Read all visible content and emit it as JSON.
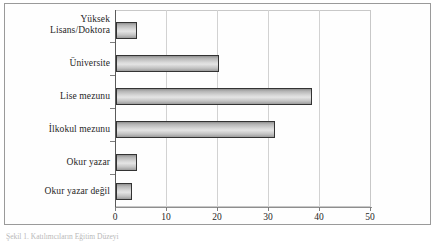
{
  "chart_data": {
    "type": "bar",
    "orientation": "horizontal",
    "title": "",
    "xlabel": "",
    "ylabel": "",
    "categories": [
      "Okur yazar değil",
      "Okur yazar",
      "İlkokul mezunu",
      "Lise mezunu",
      "Üniversite",
      "Yüksek\nLisans/Doktora"
    ],
    "values": [
      3.1,
      4.1,
      31.0,
      38.2,
      20.2,
      4.1
    ],
    "xlim": [
      0,
      50
    ],
    "xticks": [
      "0",
      "10",
      "20",
      "30",
      "40",
      "50"
    ],
    "xtick_values": [
      0,
      10,
      20,
      30,
      40,
      50
    ],
    "grid": "vertical",
    "legend": "none",
    "series_name": "",
    "bar_fill": "#d8d8d8",
    "bar_edge": "#333333",
    "grid_color": "#d2d2d2",
    "axis_color": "#5a5a5a"
  },
  "caption": {
    "text": "Şekil 1. Katılımcıların Eğitim Düzeyi"
  }
}
